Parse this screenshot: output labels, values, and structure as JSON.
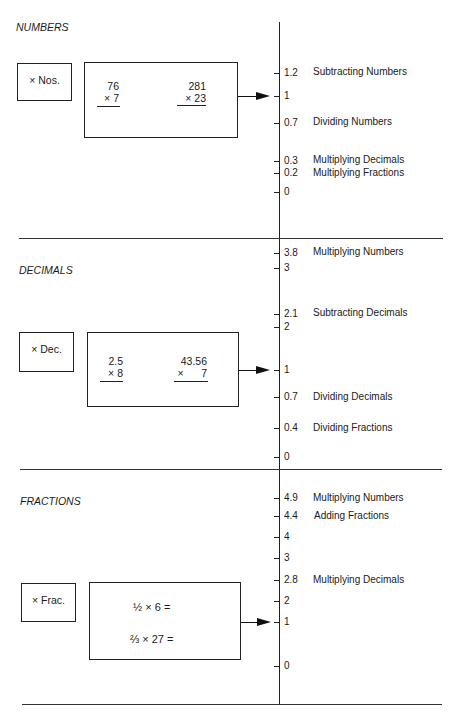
{
  "sections": [
    {
      "title": "NUMBERS",
      "button_label": "× Nos.",
      "problems": [
        {
          "top": "76",
          "bottom": "× 7"
        },
        {
          "top": "281",
          "bottom": "× 23"
        }
      ],
      "scale": [
        {
          "value": "1.2",
          "skill": "Subtracting Numbers"
        },
        {
          "value": "1",
          "skill": ""
        },
        {
          "value": "0.7",
          "skill": "Dividing Numbers"
        },
        {
          "value": "0.3",
          "skill": "Multiplying Decimals"
        },
        {
          "value": "0.2",
          "skill": "Multiplying Fractions"
        },
        {
          "value": "0",
          "skill": ""
        }
      ]
    },
    {
      "title": "DECIMALS",
      "button_label": "× Dec.",
      "problems": [
        {
          "top": "2.5",
          "bottom": "×   8"
        },
        {
          "top": "43.56",
          "bottom": "×      7"
        }
      ],
      "scale": [
        {
          "value": "3.8",
          "skill": "Multiplying Numbers"
        },
        {
          "value": "3",
          "skill": ""
        },
        {
          "value": "2.1",
          "skill": "Subtracting Decimals"
        },
        {
          "value": "2",
          "skill": ""
        },
        {
          "value": "1",
          "skill": ""
        },
        {
          "value": "0.7",
          "skill": "Dividing Decimals"
        },
        {
          "value": "0.4",
          "skill": "Dividing Fractions"
        },
        {
          "value": "0",
          "skill": ""
        }
      ]
    },
    {
      "title": "FRACTIONS",
      "button_label": "× Frac.",
      "problems": [
        {
          "expr": "½ × 6 ="
        },
        {
          "expr": "⅔ × 27 ="
        }
      ],
      "scale": [
        {
          "value": "4.9",
          "skill": "Multiplying Numbers"
        },
        {
          "value": "4.4",
          "skill": "Adding Fractions"
        },
        {
          "value": "4",
          "skill": ""
        },
        {
          "value": "3",
          "skill": ""
        },
        {
          "value": "2.8",
          "skill": "Multiplying Decimals"
        },
        {
          "value": "2",
          "skill": ""
        },
        {
          "value": "1",
          "skill": ""
        },
        {
          "value": "0",
          "skill": ""
        }
      ]
    }
  ]
}
